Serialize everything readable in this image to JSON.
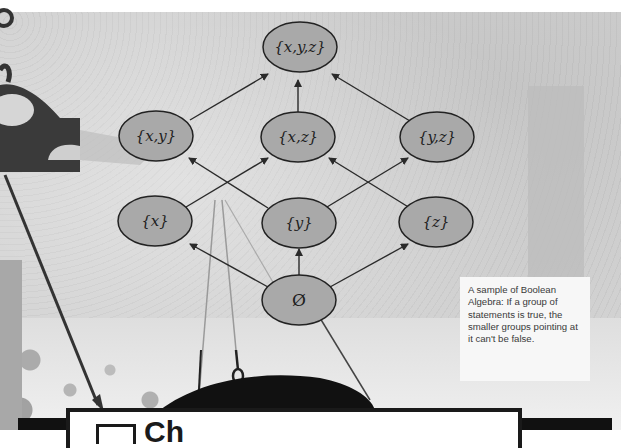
{
  "diagram": {
    "type": "boolean-algebra-lattice",
    "nodes": [
      {
        "id": "xyz",
        "label": "{x,y,z}",
        "cx": 300,
        "cy": 47
      },
      {
        "id": "xy",
        "label": "{x,y}",
        "cx": 156,
        "cy": 136
      },
      {
        "id": "xz",
        "label": "{x,z}",
        "cx": 298,
        "cy": 137
      },
      {
        "id": "yz",
        "label": "{y,z}",
        "cx": 437,
        "cy": 137
      },
      {
        "id": "x",
        "label": "{x}",
        "cx": 155,
        "cy": 221
      },
      {
        "id": "y",
        "label": "{y}",
        "cx": 299,
        "cy": 223
      },
      {
        "id": "z",
        "label": "{z}",
        "cx": 436,
        "cy": 222
      },
      {
        "id": "empty",
        "label": "Ø",
        "cx": 299,
        "cy": 300
      }
    ],
    "edges": [
      {
        "from": "xy",
        "to": "xyz"
      },
      {
        "from": "xz",
        "to": "xyz"
      },
      {
        "from": "yz",
        "to": "xyz"
      },
      {
        "from": "x",
        "to": "xy"
      },
      {
        "from": "x",
        "to": "xz"
      },
      {
        "from": "y",
        "to": "xy"
      },
      {
        "from": "y",
        "to": "yz"
      },
      {
        "from": "z",
        "to": "xz"
      },
      {
        "from": "z",
        "to": "yz"
      },
      {
        "from": "empty",
        "to": "x"
      },
      {
        "from": "empty",
        "to": "y"
      },
      {
        "from": "empty",
        "to": "z"
      }
    ],
    "colors": {
      "node_fill": "#a9a9a9",
      "node_stroke": "#222222",
      "edge": "#2a2a2a"
    }
  },
  "caption": {
    "text": "A sample of Boolean Algebra: If a group of statements is true, the smaller groups pointing at it can't be false."
  },
  "bottom_box": {
    "heading_partial": "Ch"
  }
}
